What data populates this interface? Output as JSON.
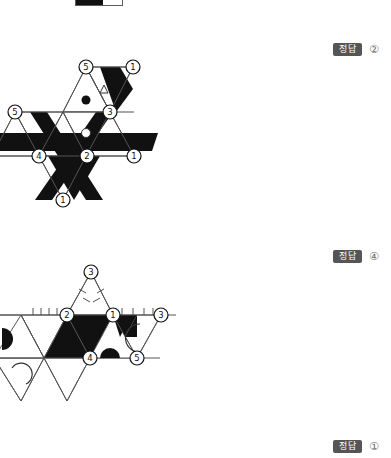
{
  "page": {
    "background_color": "#ffffff",
    "ink_color": "#111111",
    "line_color": "#4a4a4a"
  },
  "top_artifact": {
    "name": "clipped-legend-swatch",
    "dark_color": "#111111",
    "light_color": "#ffffff",
    "border_color": "#5a5a5a"
  },
  "answers": [
    {
      "label": "정답",
      "choice": "②",
      "badge_color": "#555555",
      "text_color": "#ffffff"
    },
    {
      "label": "정답",
      "choice": "④",
      "badge_color": "#555555",
      "text_color": "#ffffff"
    },
    {
      "label": "정답",
      "choice": "①",
      "badge_color": "#555555",
      "text_color": "#ffffff"
    }
  ],
  "figures": [
    {
      "id": "figure-1",
      "caption": "",
      "vertex_labels": [
        {
          "text": "5",
          "x": 86,
          "y": 12
        },
        {
          "text": "1",
          "x": 133,
          "y": 12
        },
        {
          "text": "5",
          "x": 15,
          "y": 57
        },
        {
          "text": "3",
          "x": 110,
          "y": 57
        },
        {
          "text": "4",
          "x": 39,
          "y": 101
        },
        {
          "text": "2",
          "x": 87,
          "y": 101
        },
        {
          "text": "1",
          "x": 134,
          "y": 101
        },
        {
          "text": "1",
          "x": 63,
          "y": 145
        }
      ],
      "markers": [
        {
          "kind": "filled-dot",
          "x": 86,
          "y": 45
        },
        {
          "kind": "open-circle",
          "x": 86,
          "y": 78
        },
        {
          "kind": "open-triangle",
          "x": 104,
          "y": 34
        },
        {
          "kind": "filled-dot",
          "x": 17,
          "y": 90
        }
      ]
    },
    {
      "id": "figure-2",
      "caption": "",
      "vertex_labels": [
        {
          "text": "3",
          "x": 91,
          "y": 10
        },
        {
          "text": "2",
          "x": 67,
          "y": 53
        },
        {
          "text": "1",
          "x": 113,
          "y": 53
        },
        {
          "text": "3",
          "x": 161,
          "y": 53
        },
        {
          "text": "4",
          "x": 90,
          "y": 96
        },
        {
          "text": "5",
          "x": 137,
          "y": 96
        }
      ],
      "markers": [
        {
          "kind": "half-disc-left",
          "x": 8,
          "y": 75
        },
        {
          "kind": "half-disc-up",
          "x": 110,
          "y": 96
        },
        {
          "kind": "arc-outline",
          "x": 18,
          "y": 118
        },
        {
          "kind": "arc-outline",
          "x": 146,
          "y": 75
        }
      ]
    }
  ]
}
